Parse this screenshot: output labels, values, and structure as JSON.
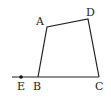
{
  "diagram": {
    "type": "geometry",
    "shape": "quadrilateral",
    "points": {
      "A": {
        "label": "A",
        "x": 47,
        "y": 27
      },
      "B": {
        "label": "B",
        "x": 38,
        "y": 77
      },
      "C": {
        "label": "C",
        "x": 99,
        "y": 77
      },
      "D": {
        "label": "D",
        "x": 88,
        "y": 19
      },
      "E": {
        "label": "E",
        "x": 21,
        "y": 77
      }
    },
    "segments": [
      "AB",
      "AD",
      "DC",
      "BC",
      "EB"
    ],
    "colors": {
      "stroke": "#222222",
      "background": "#ffffff"
    }
  }
}
